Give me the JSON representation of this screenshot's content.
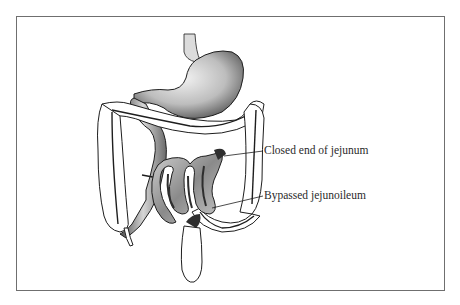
{
  "figure": {
    "labels": [
      {
        "id": "closed-end",
        "text": "Closed end of jejunum"
      },
      {
        "id": "bypassed",
        "text": "Bypassed jejunoileum"
      }
    ],
    "colors": {
      "frame": "#6f6f6f",
      "outline": "#1e1e1e",
      "shade_dark": "#3a3a3a",
      "shade_light": "#e8e8e8"
    }
  }
}
